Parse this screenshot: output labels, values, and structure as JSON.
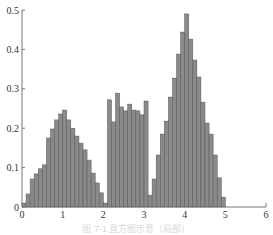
{
  "chart_data": {
    "type": "bar",
    "title": "",
    "xlabel": "",
    "ylabel": "",
    "xlim": [
      0,
      6
    ],
    "ylim": [
      0,
      0.5
    ],
    "grid": false,
    "legend": null,
    "x_ticks": [
      "0",
      "1",
      "2",
      "3",
      "4",
      "5",
      "6"
    ],
    "y_ticks": [
      "0",
      "0.1",
      "0.2",
      "0.3",
      "0.4",
      "0.5"
    ],
    "bin_width": 0.1,
    "bin_starts": [
      0.0,
      0.1,
      0.2,
      0.3,
      0.4,
      0.5,
      0.6,
      0.7,
      0.8,
      0.9,
      1.0,
      1.1,
      1.2,
      1.3,
      1.4,
      1.5,
      1.6,
      1.7,
      1.8,
      1.9,
      2.0,
      2.1,
      2.2,
      2.3,
      2.4,
      2.5,
      2.6,
      2.7,
      2.8,
      2.9,
      3.0,
      3.1,
      3.2,
      3.3,
      3.4,
      3.5,
      3.6,
      3.7,
      3.8,
      3.9,
      4.0,
      4.1,
      4.2,
      4.3,
      4.4,
      4.5,
      4.6,
      4.7,
      4.8,
      4.9
    ],
    "values": [
      0.01,
      0.033,
      0.071,
      0.084,
      0.097,
      0.107,
      0.175,
      0.198,
      0.221,
      0.236,
      0.246,
      0.221,
      0.2,
      0.18,
      0.162,
      0.145,
      0.119,
      0.086,
      0.061,
      0.036,
      0.01,
      0.272,
      0.216,
      0.289,
      0.254,
      0.244,
      0.261,
      0.246,
      0.244,
      0.234,
      0.269,
      0.03,
      0.071,
      0.132,
      0.185,
      0.218,
      0.279,
      0.327,
      0.388,
      0.444,
      0.49,
      0.426,
      0.373,
      0.33,
      0.266,
      0.213,
      0.185,
      0.132,
      0.074,
      0.025
    ]
  },
  "caption": "图 7-1 直方图示意（局部）"
}
